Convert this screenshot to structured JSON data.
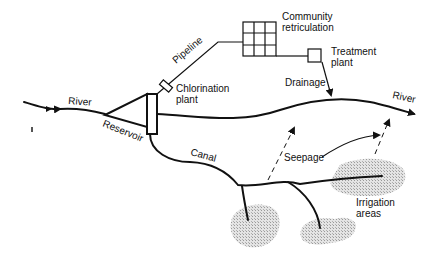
{
  "diagram": {
    "type": "water-use schematic",
    "labels": {
      "river_in": "River",
      "river_out": "River",
      "reservoir": "Reservoir",
      "pipeline": "Pipeline",
      "chlorination_1": "Chlorination",
      "chlorination_2": "plant",
      "community_1": "Community",
      "community_2": "retriculation",
      "treatment_1": "Treatment",
      "treatment_2": "plant",
      "drainage": "Drainage",
      "canal": "Canal",
      "seepage": "Seepage",
      "irrigation_1": "Irrigation",
      "irrigation_2": "areas"
    },
    "colors": {
      "ink": "#111111",
      "stipple": "#c8c8c8",
      "background": "#ffffff"
    }
  }
}
